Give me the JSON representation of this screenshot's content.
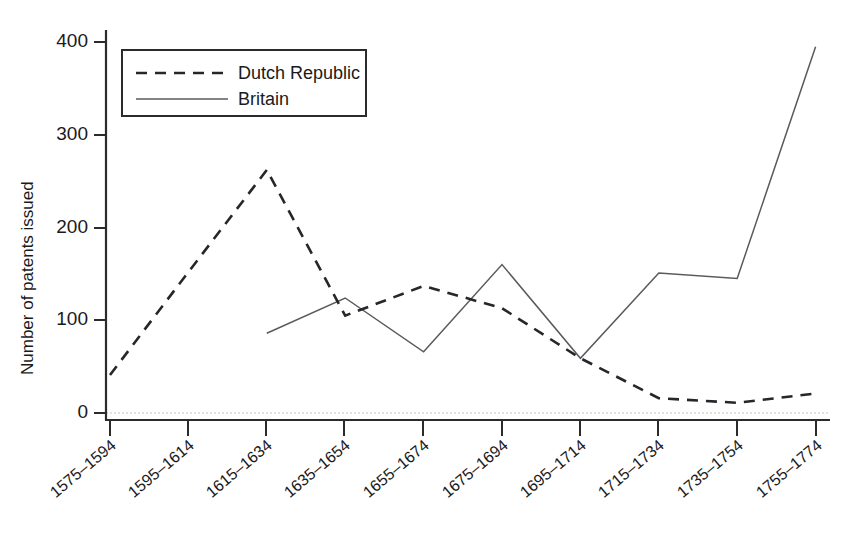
{
  "chart_data": {
    "type": "line",
    "title": "",
    "xlabel": "",
    "ylabel": "Number of patents issued",
    "categories": [
      "1575–1594",
      "1595–1614",
      "1615–1634",
      "1635–1654",
      "1655–1674",
      "1675–1694",
      "1695–1714",
      "1715–1734",
      "1735–1754",
      "1755–1774"
    ],
    "series": [
      {
        "name": "Dutch Republic",
        "style": "dashed",
        "color": "#26262b",
        "values": [
          41,
          152,
          262,
          105,
          137,
          113,
          59,
          16,
          11,
          21
        ]
      },
      {
        "name": "Britain",
        "style": "solid",
        "color": "#5a5a5e",
        "values": [
          null,
          null,
          86,
          124,
          66,
          160,
          59,
          151,
          145,
          395
        ]
      }
    ],
    "yticks": [
      0,
      100,
      200,
      300,
      400
    ],
    "ytick_labels": [
      "0",
      "100",
      "200",
      "300",
      "400"
    ],
    "ylim": [
      0,
      430
    ],
    "grid": "zero-line-only",
    "legend": {
      "position": "top-left-inside",
      "entries": [
        {
          "label": "Dutch Republic",
          "style": "dashed"
        },
        {
          "label": "Britain",
          "style": "solid"
        }
      ]
    }
  }
}
